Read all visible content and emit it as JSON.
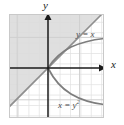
{
  "figure": {
    "title": "",
    "axes": {
      "x_label": "x",
      "y_label": "y"
    },
    "labels": {
      "line_label": "y = x",
      "line_label_plain": "y = x",
      "parabola_label_base": "x = y",
      "parabola_label_exponent": "2",
      "parabola_label_plain": "x = y2"
    },
    "colors": {
      "axis": "#1a1a1a",
      "grid_minor": "#dcdcdc",
      "grid_major": "#c9c9c9",
      "curve": "#7d7d7d",
      "line": "#8c8c8c",
      "shade": "#d9d9d9",
      "plot_background": "#ffffff",
      "page_background": "#ffffff",
      "label_text": "#4a4a4a"
    },
    "grid": {
      "visible": true,
      "spacing_px": 10.4,
      "x_divisions": 9,
      "y_divisions": 10
    },
    "origin_px": {
      "x": 39,
      "y": 54
    },
    "shaded_region": {
      "description": "half-plane above the line y = x",
      "fill": "#d9d9d9"
    },
    "curves": [
      {
        "name": "line-y-equals-x",
        "equation": "y = x",
        "style": "solid"
      },
      {
        "name": "curve-sqrt-x",
        "equation": "y = sqrt(x)",
        "style": "solid"
      },
      {
        "name": "curve-neg-sqrt-x",
        "equation": "y = -sqrt(x)",
        "style": "solid"
      }
    ]
  }
}
